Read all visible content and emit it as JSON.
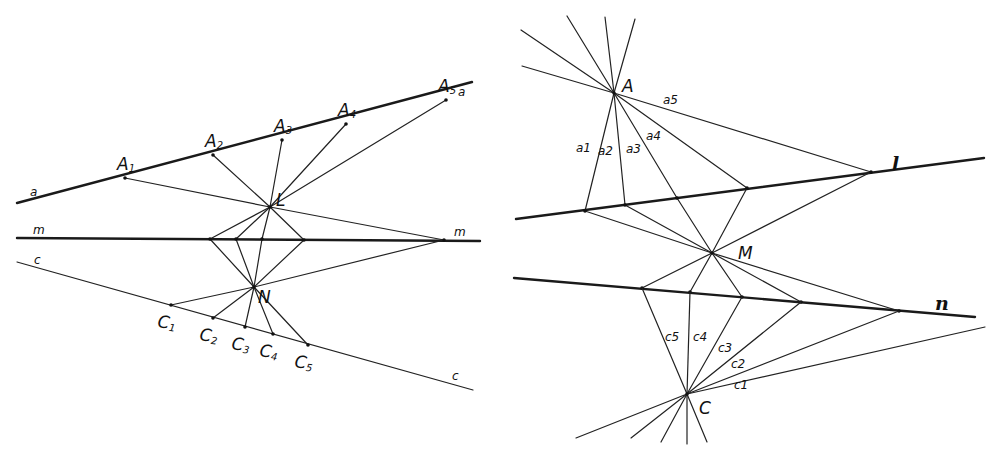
{
  "left_figure": {
    "line_a": {
      "label": "a",
      "from": [
        17,
        203
      ],
      "to": [
        472,
        82
      ]
    },
    "line_m": {
      "label": "m",
      "from": [
        17,
        238
      ],
      "to": [
        480,
        241
      ]
    },
    "line_c": {
      "label": "c",
      "from": [
        17,
        262
      ],
      "to": [
        473,
        390
      ]
    },
    "points_A": [
      {
        "name": "A",
        "sub": "1",
        "x": 125,
        "y": 178
      },
      {
        "name": "A",
        "sub": "2",
        "x": 213,
        "y": 155
      },
      {
        "name": "A",
        "sub": "3",
        "x": 282,
        "y": 140
      },
      {
        "name": "A",
        "sub": "4",
        "x": 346,
        "y": 124
      },
      {
        "name": "A",
        "sub": "5",
        "x": 446,
        "y": 100
      }
    ],
    "points_C": [
      {
        "name": "C",
        "sub": "1",
        "x": 171,
        "y": 305
      },
      {
        "name": "C",
        "sub": "2",
        "x": 213,
        "y": 318
      },
      {
        "name": "C",
        "sub": "3",
        "x": 245,
        "y": 327
      },
      {
        "name": "C",
        "sub": "4",
        "x": 273,
        "y": 334
      },
      {
        "name": "C",
        "sub": "5",
        "x": 308,
        "y": 345
      }
    ],
    "points_m": [
      [
        210,
        239
      ],
      [
        236,
        239
      ],
      [
        262,
        239
      ],
      [
        304,
        240
      ]
    ],
    "m_far_point": [
      444,
      240
    ],
    "point_L": {
      "label": "L",
      "x": 270,
      "y": 207
    },
    "point_N": {
      "label": "N",
      "x": 254,
      "y": 287
    },
    "labels": {
      "a_left": "a",
      "a_right": "a",
      "m_left": "m",
      "m_right": "m",
      "c_left": "c",
      "c_right": "c",
      "L": "L",
      "N": "N"
    }
  },
  "right_figure": {
    "line_l": {
      "label": "l",
      "from": [
        516,
        219
      ],
      "to": [
        984,
        158
      ]
    },
    "line_n": {
      "label": "n",
      "from": [
        514,
        278
      ],
      "to": [
        975,
        317
      ]
    },
    "point_A": {
      "label": "A",
      "x": 614,
      "y": 93
    },
    "point_M": {
      "label": "M",
      "x": 712,
      "y": 253
    },
    "point_C": {
      "label": "C",
      "x": 687,
      "y": 394
    },
    "points_l": [
      [
        585,
        211
      ],
      [
        625,
        205
      ],
      [
        677,
        198
      ],
      [
        747,
        188
      ],
      [
        871,
        172
      ]
    ],
    "points_n": [
      [
        642,
        288
      ],
      [
        690,
        292
      ],
      [
        742,
        297
      ],
      [
        801,
        302
      ],
      [
        899,
        311
      ]
    ],
    "rays_above_A": [
      [
        522,
        66
      ],
      [
        567,
        16
      ],
      [
        605,
        17
      ],
      [
        635,
        19
      ],
      [
        521,
        30
      ]
    ],
    "rays_below_C": [
      [
        576,
        438
      ],
      [
        631,
        438
      ],
      [
        661,
        442
      ],
      [
        687,
        444
      ],
      [
        707,
        442
      ]
    ],
    "labels": {
      "l": "l",
      "n": "n",
      "A": "A",
      "M": "M",
      "C": "C",
      "a1": "a1",
      "a2": "a2",
      "a3": "a3",
      "a4": "a4",
      "a5": "a5",
      "c1": "c1",
      "c2": "c2",
      "c3": "c3",
      "c4": "c4",
      "c5": "c5"
    }
  }
}
